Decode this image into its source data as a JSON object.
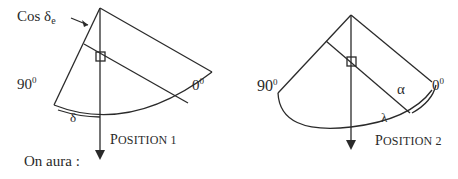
{
  "diagram": {
    "position1": {
      "cos_label": "Cos δ",
      "cos_subscript": "e",
      "angle_90": "90",
      "angle_0": "0",
      "degree_mark": "0",
      "arc_label": "δ",
      "caption_initial": "P",
      "caption_rest": "OSITION 1"
    },
    "position2": {
      "angle_90": "90",
      "angle_0": "0",
      "degree_mark": "0",
      "alpha_label": "α",
      "arc_label": "λ",
      "caption_initial": "P",
      "caption_rest": "OSITION 2"
    },
    "footer_text": "On aura :"
  }
}
